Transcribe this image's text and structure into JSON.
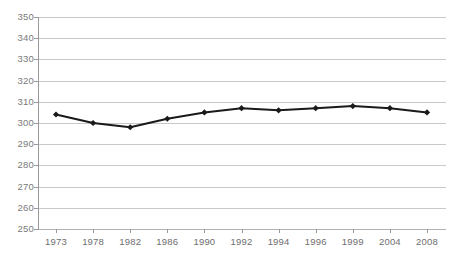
{
  "chart_data": {
    "type": "line",
    "title": "",
    "subtitle": "",
    "xlabel": "",
    "ylabel": "",
    "categories": [
      "1973",
      "1978",
      "1982",
      "1986",
      "1990",
      "1992",
      "1994",
      "1996",
      "1999",
      "2004",
      "2008"
    ],
    "series": [
      {
        "name": "",
        "values": [
          304,
          300,
          298,
          302,
          305,
          307,
          306,
          307,
          308,
          307,
          305
        ]
      }
    ],
    "x": [
      "1973",
      "1978",
      "1982",
      "1986",
      "1990",
      "1992",
      "1994",
      "1996",
      "1999",
      "2004",
      "2008"
    ],
    "values": [
      304,
      300,
      298,
      302,
      305,
      307,
      306,
      307,
      308,
      307,
      305
    ],
    "ylim": [
      250,
      350
    ],
    "ytick_step": 10,
    "yticks": [
      "350",
      "340",
      "330",
      "320",
      "310",
      "300",
      "290",
      "280",
      "270",
      "260",
      "250"
    ],
    "grid": true,
    "grid_axis": "y",
    "legend": false,
    "legend_position": "none",
    "annotations": [],
    "colors": {
      "line": "#1a1a1a",
      "marker": "#1a1a1a",
      "gridline": "#c9c9c9",
      "axis": "#9a9a9a",
      "tick_label": "#7a7a7a",
      "background": "#ffffff"
    },
    "marker_shape": "diamond",
    "line_width": 2
  }
}
